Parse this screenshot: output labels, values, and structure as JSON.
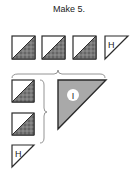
{
  "title": "Make 5.",
  "labels": {
    "half_triangle_unit": "H",
    "large_triangle_unit": "I"
  },
  "colors": {
    "outline": "#2a2a2a",
    "print_fill": "#6e6e6e",
    "large_triangle_fill": "#a9a9a9",
    "brace": "#888888",
    "background": "#ffffff"
  },
  "units": {
    "top_row": [
      "half-square-triangle",
      "half-square-triangle",
      "half-square-triangle",
      "triangle-H"
    ],
    "left_column": [
      "half-square-triangle",
      "half-square-triangle",
      "triangle-H"
    ],
    "center": "triangle-I"
  }
}
